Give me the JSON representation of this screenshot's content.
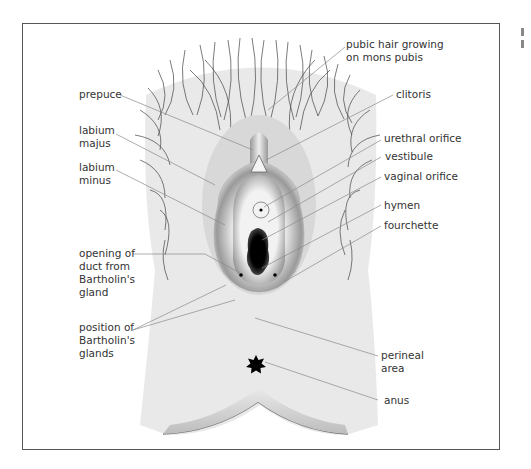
{
  "diagram": {
    "labels": [
      {
        "id": "pubic-hair",
        "lines": [
          "pubic hair growing",
          "on mons pubis"
        ]
      },
      {
        "id": "prepuce",
        "lines": [
          "prepuce"
        ]
      },
      {
        "id": "clitoris",
        "lines": [
          "clitoris"
        ]
      },
      {
        "id": "labium-majus",
        "lines": [
          "labium",
          "majus"
        ]
      },
      {
        "id": "urethral-orifice",
        "lines": [
          "urethral orifice"
        ]
      },
      {
        "id": "vestibule",
        "lines": [
          "vestibule"
        ]
      },
      {
        "id": "labium-minus",
        "lines": [
          "labium",
          "minus"
        ]
      },
      {
        "id": "vaginal-orifice",
        "lines": [
          "vaginal orifice"
        ]
      },
      {
        "id": "hymen",
        "lines": [
          "hymen"
        ]
      },
      {
        "id": "fourchette",
        "lines": [
          "fourchette"
        ]
      },
      {
        "id": "bartholin-duct",
        "lines": [
          "opening of",
          "duct from",
          "Bartholin's",
          "gland"
        ]
      },
      {
        "id": "bartholin-glands",
        "lines": [
          "position of",
          "Bartholin's",
          "glands"
        ]
      },
      {
        "id": "perineal-area",
        "lines": [
          "perineal",
          "area"
        ]
      },
      {
        "id": "anus",
        "lines": [
          "anus"
        ]
      }
    ],
    "colors": {
      "skin": "#e9e9e9",
      "border": "#555555",
      "leader": "#888888",
      "text": "#333333",
      "hair": "#444444"
    }
  }
}
